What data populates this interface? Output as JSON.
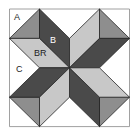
{
  "diagram": {
    "colors": {
      "dark": "#4a4a4a",
      "light": "#c8c8c8",
      "medium": "#8e8e8e",
      "background": "#ffffff",
      "stroke": "#222222"
    },
    "labels": {
      "a": "A",
      "b": "B",
      "br": "BR",
      "c": "C"
    }
  }
}
